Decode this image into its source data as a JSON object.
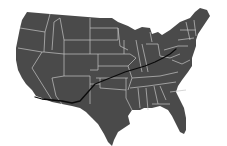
{
  "map": {
    "subject": "Contiguous United States",
    "colors": {
      "background": "#ffffff",
      "land": "#4a4a4a",
      "state_border": "#c4c4c4",
      "route": "#0a0a0a"
    },
    "route": {
      "description": "Cross-country route from southern California to the mid-Atlantic",
      "points": [
        [
          35,
          97
        ],
        [
          42,
          99
        ],
        [
          52,
          100
        ],
        [
          62,
          101
        ],
        [
          72,
          103
        ],
        [
          80,
          101
        ],
        [
          88,
          92
        ],
        [
          95,
          84
        ],
        [
          105,
          80
        ],
        [
          115,
          76
        ],
        [
          125,
          72
        ],
        [
          135,
          69
        ],
        [
          145,
          66
        ],
        [
          155,
          62
        ],
        [
          163,
          58
        ],
        [
          170,
          54
        ],
        [
          176,
          49
        ]
      ]
    }
  }
}
